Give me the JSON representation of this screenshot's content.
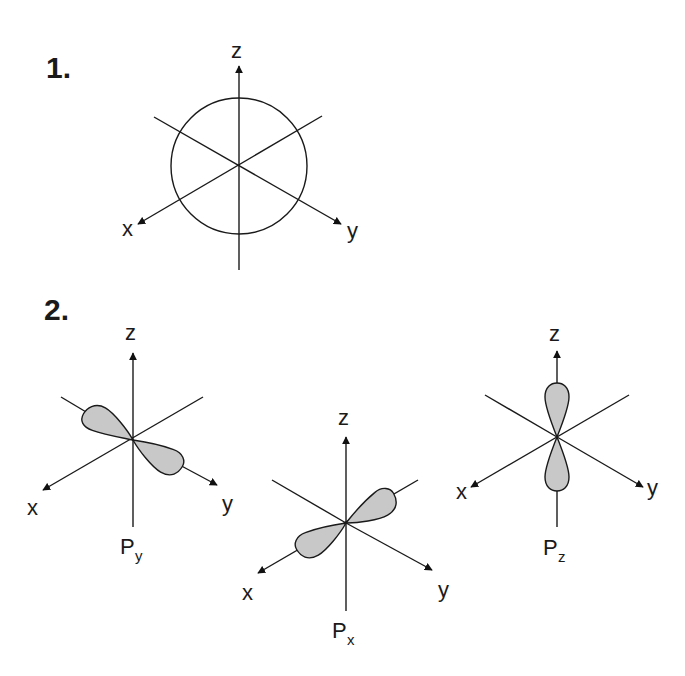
{
  "figure": {
    "part1": {
      "number": "1.",
      "description": "s orbital (sphere) on 3D axes",
      "axes": {
        "z": "z",
        "x": "x",
        "y": "y"
      }
    },
    "part2": {
      "number": "2.",
      "orbitals": [
        {
          "name": "P",
          "subscript": "y",
          "axes": {
            "z": "z",
            "x": "x",
            "y": "y"
          }
        },
        {
          "name": "P",
          "subscript": "x",
          "axes": {
            "z": "z",
            "x": "x",
            "y": "y"
          }
        },
        {
          "name": "P",
          "subscript": "z",
          "axes": {
            "z": "z",
            "x": "x",
            "y": "y"
          }
        }
      ]
    },
    "colors": {
      "lobe_fill": "#c8c8c8",
      "line": "#1a1a1a",
      "background": "#ffffff"
    }
  }
}
